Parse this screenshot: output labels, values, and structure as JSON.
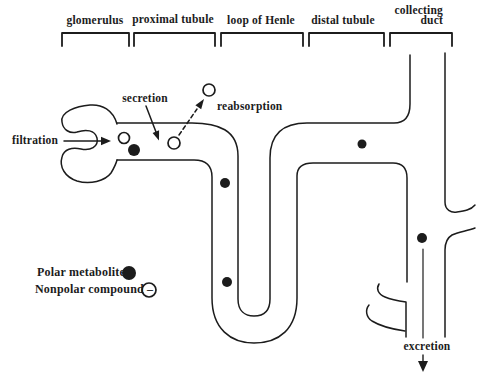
{
  "figure": {
    "background": "#ffffff",
    "line_color": "#1c1c1c",
    "region_labels": {
      "glomerulus": "glomerulus",
      "proximal_tubule": "proximal tubule",
      "loop_of_henle": "loop of Henle",
      "distal_tubule": "distal tubule",
      "collecting_duct_line1": "collecting",
      "collecting_duct_line2": "duct"
    },
    "process_labels": {
      "filtration": "filtration",
      "secretion": "secretion",
      "reabsorption": "reabsorption",
      "excretion": "excretion"
    },
    "legend": {
      "polar": {
        "label": "Polar metabolite =",
        "marker": "filled-circle"
      },
      "nonpolar": {
        "label": "Nonpolar compound –",
        "marker": "open-circle"
      }
    },
    "markers": {
      "filled_circles": [
        {
          "name": "polar-metabolite-in-proximal-tubule",
          "x": 134,
          "y": 150,
          "r": 6
        },
        {
          "name": "polar-metabolite-in-descending-proximal",
          "x": 225,
          "y": 183,
          "r": 5
        },
        {
          "name": "polar-metabolite-in-loop-of-henle",
          "x": 227,
          "y": 282,
          "r": 5
        },
        {
          "name": "polar-metabolite-in-distal-tubule",
          "x": 362,
          "y": 144,
          "r": 4.5
        },
        {
          "name": "polar-metabolite-in-collecting-duct",
          "x": 422,
          "y": 238,
          "r": 5
        },
        {
          "name": "legend-polar-marker",
          "x": 129,
          "y": 273,
          "r": 7
        }
      ],
      "open_circles": [
        {
          "name": "nonpolar-compound-filtered",
          "x": 124,
          "y": 138,
          "r": 5.5
        },
        {
          "name": "nonpolar-compound-in-tubule",
          "x": 174,
          "y": 143,
          "r": 6
        },
        {
          "name": "nonpolar-compound-reabsorbed",
          "x": 209,
          "y": 90,
          "r": 6
        },
        {
          "name": "legend-nonpolar-marker",
          "x": 149,
          "y": 290,
          "r": 7
        }
      ]
    }
  }
}
